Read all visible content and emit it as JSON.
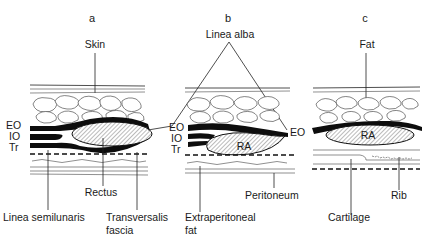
{
  "panels": [
    {
      "letter": "a",
      "labels": {
        "top": "Skin",
        "eo": "EO",
        "io": "IO",
        "tr": "Tr",
        "muscle": "Rectus",
        "bottom_left": "Linea semilunaris",
        "bottom_right_1": "Transversalis",
        "bottom_right_2": "fascia"
      }
    },
    {
      "letter": "b",
      "labels": {
        "top": "Linea alba",
        "eo_left": "EO",
        "io": "IO",
        "tr": "Tr",
        "muscle": "RA",
        "eo_right": "EO",
        "bottom_left_1": "Extraperitoneal",
        "bottom_left_2": "fat",
        "bottom_right": "Peritoneum"
      }
    },
    {
      "letter": "c",
      "labels": {
        "top": "Fat",
        "muscle": "RA",
        "bottom_left": "Cartilage",
        "bottom_right": "Rib"
      }
    }
  ],
  "colors": {
    "line": "#222222",
    "muscle": "#0d0d0d",
    "background": "#ffffff"
  }
}
